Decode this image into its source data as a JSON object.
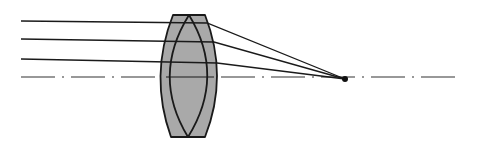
{
  "diagram": {
    "title": "Converging lens doublet focusing parallel rays",
    "colors": {
      "background": "#ffffff",
      "lens_fill": "#a9a9a9",
      "stroke": "#1a1a1a",
      "axis": "#333333"
    },
    "lens": {
      "outer": {
        "top_left": [
          173,
          15
        ],
        "top_right": [
          205,
          15
        ],
        "bottom_left": [
          171,
          137
        ],
        "bottom_right": [
          205,
          137
        ],
        "left_bulge_x": 161,
        "right_bulge_x": 217
      },
      "inner": {
        "top": [
          189,
          15
        ],
        "bottom": [
          188,
          137
        ],
        "left_bulge_x": 170,
        "right_bulge_x": 207
      }
    },
    "rays": [
      {
        "start": [
          21,
          21
        ],
        "lens_entry": [
          174,
          22
        ],
        "focus": [
          345,
          79
        ]
      },
      {
        "start": [
          21,
          39
        ],
        "lens_entry": [
          166,
          40
        ],
        "focus": [
          345,
          79
        ]
      },
      {
        "start": [
          21,
          59
        ],
        "lens_entry": [
          162,
          60
        ],
        "focus": [
          345,
          79
        ]
      }
    ],
    "optical_axis": {
      "y": 77,
      "x_start": 21,
      "x_end": 462,
      "style": "dash-dot"
    },
    "focal_point": {
      "x": 345,
      "y": 79,
      "r": 3
    }
  }
}
